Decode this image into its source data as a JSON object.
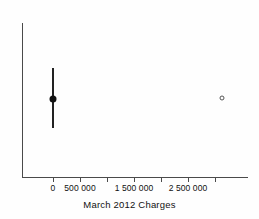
{
  "chart_data": {
    "type": "scatter",
    "title": "",
    "xlabel": "March 2012 Charges",
    "ylabel": "",
    "xlim": [
      -230000,
      3100000
    ],
    "grid": false,
    "legend": null,
    "tick_values": [
      0,
      500000,
      1000000,
      1500000,
      2000000,
      2500000,
      3000000
    ],
    "tick_labels": [
      "0",
      "500 000",
      "",
      "1 500 000",
      "",
      "2 500 000",
      ""
    ],
    "series": [
      {
        "name": "estimate-with-error-bar",
        "marker": "filled-circle",
        "x": [
          0
        ],
        "y": [
          0.5
        ],
        "x_error_low": [
          -620000
        ],
        "x_error_high": [
          560000
        ],
        "orientation": "vertical-bar-at-x"
      },
      {
        "name": "outlier",
        "marker": "open-circle",
        "x": [
          3130000
        ],
        "y": [
          0.51
        ]
      }
    ],
    "axis_labels": [
      {
        "text": "0",
        "value": 0
      },
      {
        "text": "500 000",
        "value": 500000
      },
      {
        "text": "1 500 000",
        "value": 1500000
      },
      {
        "text": "2 500 000",
        "value": 2500000
      }
    ]
  },
  "geometry": {
    "ticks_px": [
      53,
      80,
      107,
      134,
      161,
      188,
      215
    ],
    "labeled_ticks_px": [
      {
        "x": 53,
        "label": "0"
      },
      {
        "x": 80,
        "label": "500 000"
      },
      {
        "x": 134,
        "label": "1 500 000"
      },
      {
        "x": 188,
        "label": "2 500 000"
      }
    ],
    "errorbar": {
      "x": 53,
      "top": 68,
      "bottom": 128
    },
    "point_filled": {
      "x": 53,
      "y": 99
    },
    "point_open": {
      "x": 222,
      "y": 98
    }
  },
  "colors": {
    "axis": "#4a4a4a",
    "marker_filled": "#111111",
    "marker_open_stroke": "#555555",
    "text": "#111111",
    "background": "#fefefe"
  }
}
